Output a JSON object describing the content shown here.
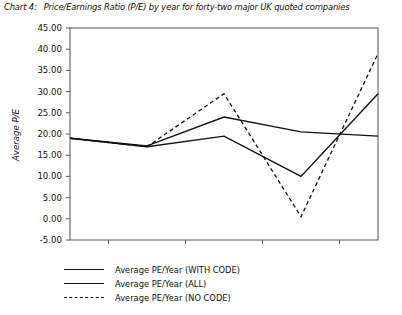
{
  "caption": {
    "label": "Chart 4:",
    "text": "Price/Earnings Ratio (P/E) by year for forty-two major UK quoted companies"
  },
  "axes": {
    "ytitle": "Average P/E",
    "yticks": [
      "45.00",
      "40.00",
      "35.00",
      "30.00",
      "25.00",
      "20.00",
      "15.00",
      "10.00",
      "5.00",
      "0.00",
      "-5.00"
    ],
    "xticks": [
      "1997",
      "1998",
      "1999",
      "2000",
      "2001"
    ]
  },
  "legend": {
    "items": [
      {
        "label": "Average PE/Year (WITH CODE)",
        "style": "solid"
      },
      {
        "label": "Average PE/Year (ALL)",
        "style": "solid"
      },
      {
        "label": "Average PE/Year (NO CODE)",
        "style": "dashed"
      }
    ]
  },
  "colors": {
    "line": "#111111",
    "axis": "#555555",
    "background": "#ffffff"
  },
  "chart_data": {
    "type": "line",
    "title": "Price/Earnings Ratio (P/E) by year for forty-two major UK quoted companies",
    "xlabel": "",
    "ylabel": "Average P/E",
    "categories": [
      "1997",
      "1998",
      "1999",
      "2000",
      "2001"
    ],
    "ylim": [
      -5,
      45
    ],
    "ytick_step": 5,
    "grid": false,
    "legend_position": "below",
    "series": [
      {
        "name": "Average PE/Year (WITH CODE)",
        "style": "solid",
        "values": [
          19.0,
          17.0,
          19.5,
          10.0,
          29.5
        ]
      },
      {
        "name": "Average PE/Year (ALL)",
        "style": "solid",
        "values": [
          19.0,
          17.2,
          24.0,
          20.5,
          19.5
        ]
      },
      {
        "name": "Average PE/Year (NO CODE)",
        "style": "dashed",
        "values": [
          19.0,
          17.0,
          29.5,
          0.5,
          39.0
        ]
      }
    ]
  }
}
